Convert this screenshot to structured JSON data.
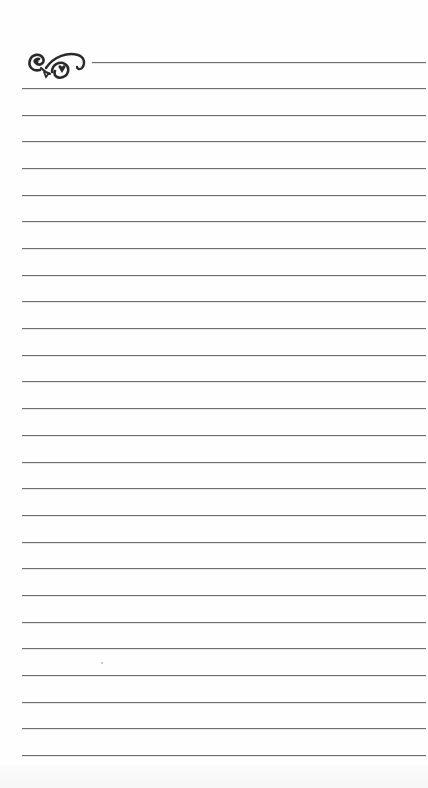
{
  "document": {
    "type": "lined-notepaper",
    "ornament": {
      "icon": "flourish-ornament-icon",
      "color": "#2a2a2a"
    },
    "rules": {
      "color": "#6e6e6e",
      "header_rule": {
        "y": 62,
        "x_start": 92,
        "x_end": 428
      },
      "body_rules": {
        "x_start": 22,
        "x_end": 428,
        "first_y": 88,
        "spacing": 26.68,
        "count": 26
      }
    },
    "text_lines": []
  }
}
